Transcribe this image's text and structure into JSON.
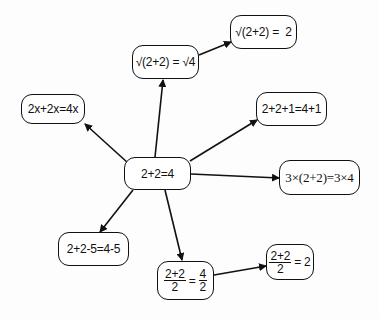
{
  "diagram": {
    "type": "concept-map",
    "center": {
      "id": "n0",
      "label": "2+2=4"
    },
    "nodes": [
      {
        "id": "n0",
        "label": "2+2=4"
      },
      {
        "id": "n1",
        "label": "√(2+2) = √4"
      },
      {
        "id": "n2",
        "label": "√(2+2) =  2"
      },
      {
        "id": "n3",
        "label": "2x+2x=4x"
      },
      {
        "id": "n4",
        "label": "2+2+1=4+1"
      },
      {
        "id": "n5",
        "label": "3×(2+2)=3×4"
      },
      {
        "id": "n6",
        "label": "2+2-5=4-5"
      },
      {
        "id": "n7",
        "label": "(2+2)/2 = 4/2",
        "frac_left": {
          "num": "2+2",
          "den": "2"
        },
        "eq": "=",
        "frac_right": {
          "num": "4",
          "den": "2"
        }
      },
      {
        "id": "n8",
        "label": "(2+2)/2 = 2",
        "frac_left": {
          "num": "2+2",
          "den": "2"
        },
        "eq": "=",
        "rhs": "2"
      }
    ],
    "edges": [
      {
        "from": "n0",
        "to": "n1"
      },
      {
        "from": "n1",
        "to": "n2"
      },
      {
        "from": "n0",
        "to": "n3"
      },
      {
        "from": "n0",
        "to": "n4"
      },
      {
        "from": "n0",
        "to": "n5"
      },
      {
        "from": "n0",
        "to": "n6"
      },
      {
        "from": "n0",
        "to": "n7"
      },
      {
        "from": "n7",
        "to": "n8"
      }
    ],
    "colors": {
      "stroke": "#111111",
      "background": "#ffffff"
    }
  }
}
